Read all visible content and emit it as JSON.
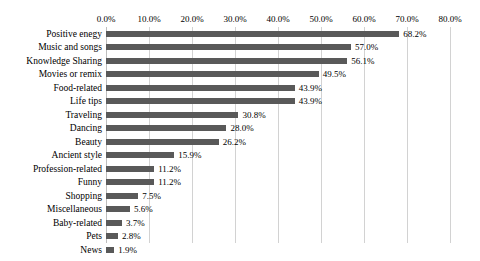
{
  "chart_data": {
    "type": "bar",
    "orientation": "horizontal",
    "title": "",
    "xlabel": "",
    "ylabel": "",
    "xlim": [
      0,
      80
    ],
    "xticks": [
      "0.0%",
      "10.0%",
      "20.0%",
      "30.0%",
      "40.0%",
      "50.0%",
      "60.0%",
      "70.0%",
      "80.0%"
    ],
    "xtick_values": [
      0,
      10,
      20,
      30,
      40,
      50,
      60,
      70,
      80
    ],
    "grid": "vertical",
    "legend": "none",
    "bar_color": "#595959",
    "gridline_color": "#d2d2d2",
    "categories": [
      "Positive enegy",
      "Music and songs",
      "Knowledge Sharing",
      "Movies or remix",
      "Food-related",
      "Life tips",
      "Traveling",
      "Dancing",
      "Beauty",
      "Ancient style",
      "Profession-related",
      "Funny",
      "Shopping",
      "Miscellaneous",
      "Baby-related",
      "Pets",
      "News"
    ],
    "values": [
      68.2,
      57.0,
      56.1,
      49.5,
      43.9,
      43.9,
      30.8,
      28.0,
      26.2,
      15.9,
      11.2,
      11.2,
      7.5,
      5.6,
      3.7,
      2.8,
      1.9
    ],
    "value_labels": [
      "68.2%",
      "57.0%",
      "56.1%",
      "49.5%",
      "43.9%",
      "43.9%",
      "30.8%",
      "28.0%",
      "26.2%",
      "15.9%",
      "11.2%",
      "11.2%",
      "7.5%",
      "5.6%",
      "3.7%",
      "2.8%",
      "1.9%"
    ]
  }
}
